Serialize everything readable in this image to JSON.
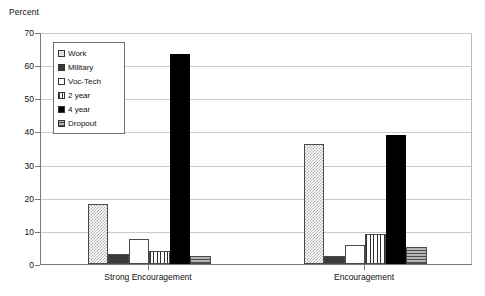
{
  "chart_data": {
    "type": "bar",
    "title": "",
    "subtitle": "",
    "xlabel": "",
    "ylabel": "Percent",
    "ylim": [
      0,
      70
    ],
    "yticks": [
      0,
      10,
      20,
      30,
      40,
      50,
      60,
      70
    ],
    "grid": true,
    "legend_position": "inside-top-left",
    "categories": [
      "Strong Encouragement",
      "Encouragement"
    ],
    "series": [
      {
        "name": "Work",
        "values": [
          18.0,
          36.2
        ],
        "pattern": "light-checker",
        "color": "#d8d8d8"
      },
      {
        "name": "Military",
        "values": [
          3.0,
          2.5
        ],
        "pattern": "solid-dark-gray",
        "color": "#3a3a3a"
      },
      {
        "name": "Voc-Tech",
        "values": [
          7.5,
          5.8
        ],
        "pattern": "empty-white",
        "color": "#ffffff"
      },
      {
        "name": "2 year",
        "values": [
          4.0,
          9.0
        ],
        "pattern": "vertical-stripes",
        "color": "#2e2e2e"
      },
      {
        "name": "4 year",
        "values": [
          63.5,
          38.8
        ],
        "pattern": "solid-black",
        "color": "#000000"
      },
      {
        "name": "Dropout",
        "values": [
          2.5,
          5.0
        ],
        "pattern": "horizontal-stripes",
        "color": "#9a9a9a"
      }
    ]
  },
  "axes": {
    "y_title": "Percent",
    "y_tick_labels": [
      "0",
      "10",
      "20",
      "30",
      "40",
      "50",
      "60",
      "70"
    ],
    "x_tick_labels": [
      "Strong Encouragement",
      "Encouragement"
    ]
  },
  "legend": {
    "items": [
      {
        "label": "Work"
      },
      {
        "label": "Military"
      },
      {
        "label": "Voc-Tech"
      },
      {
        "label": "2 year"
      },
      {
        "label": "4 year"
      },
      {
        "label": "Dropout"
      }
    ]
  }
}
